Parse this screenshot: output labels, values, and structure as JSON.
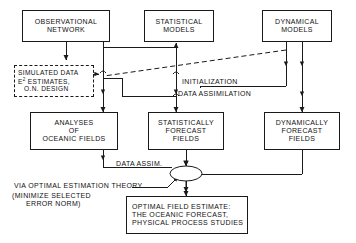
{
  "figure": {
    "type": "flowchart",
    "orientation": "top-down",
    "background_color": "#ffffff",
    "line_color": "#1a1a1a",
    "text_color": "#111111"
  },
  "nodes": {
    "observational_network": {
      "id": "observational-network",
      "shape": "rectangle",
      "border": "solid",
      "lines": [
        "OBSERVATIONAL",
        "NETWORK"
      ]
    },
    "statistical_models": {
      "id": "statistical-models",
      "shape": "rectangle",
      "border": "solid",
      "lines": [
        "STATISTICAL",
        "MODELS"
      ]
    },
    "dynamical_models": {
      "id": "dynamical-models",
      "shape": "rectangle",
      "border": "solid",
      "lines": [
        "DYNAMICAL",
        "MODELS"
      ]
    },
    "simulated_data": {
      "id": "simulated-data",
      "shape": "rectangle",
      "border": "dashed",
      "lines": [
        "SIMULATED DATA",
        "E² ESTIMATES,",
        "O.N. DESIGN"
      ],
      "line1": "SIMULATED DATA",
      "line2_prefix": "E",
      "line2_sup": "2",
      "line2_rest": " ESTIMATES,",
      "line3": "O.N. DESIGN"
    },
    "analyses_oceanic_fields": {
      "id": "analyses-of-oceanic-fields",
      "shape": "rectangle",
      "border": "solid",
      "lines": [
        "ANALYSES",
        "OF",
        "OCEANIC FIELDS"
      ]
    },
    "statistically_forecast_fields": {
      "id": "statistically-forecast-fields",
      "shape": "rectangle",
      "border": "solid",
      "lines": [
        "STATISTICALLY",
        "FORECAST",
        "FIELDS"
      ]
    },
    "dynamically_forecast_fields": {
      "id": "dynamically-forecast-fields",
      "shape": "rectangle",
      "border": "solid",
      "lines": [
        "DYNAMICALLY",
        "FORECAST",
        "FIELDS"
      ]
    },
    "optimal_field_estimate": {
      "id": "optimal-field-estimate",
      "shape": "rectangle",
      "border": "solid",
      "lines": [
        "OPTIMAL FIELD ESTIMATE:",
        "THE OCEANIC FORECAST,",
        "PHYSICAL PROCESS STUDIES"
      ]
    },
    "merge_junction": {
      "id": "merge-junction",
      "shape": "ellipse",
      "border": "solid",
      "label": ""
    }
  },
  "edge_labels": {
    "initialization": "INITIALIZATION",
    "data_assimilation": "DATA ASSIMILATION",
    "data_assim": "DATA ASSIM.",
    "via_optimal_estimation": "VIA OPTIMAL ESTIMATION THEORY",
    "minimize_line1": "(MINIMIZE SELECTED",
    "minimize_line2": "ERROR NORM)"
  },
  "edges": [
    {
      "from": "simulated_data",
      "to": "observational_network",
      "style": "solid",
      "arrow": "end"
    },
    {
      "from": "observational_network",
      "to": "analyses_oceanic_fields",
      "style": "solid",
      "arrow": "end"
    },
    {
      "from": "observational_network",
      "to": "statistical_models",
      "style": "solid",
      "arrow": "end"
    },
    {
      "from": "statistical_models",
      "to": "simulated_data",
      "style": "dashed",
      "arrow": "end"
    },
    {
      "from": "dynamical_models",
      "to": "simulated_data",
      "style": "dashed",
      "arrow": "end"
    },
    {
      "from": "statistical_models",
      "to": "statistically_forecast_fields",
      "style": "solid",
      "arrow": "end",
      "label": "initialization"
    },
    {
      "from": "dynamical_models",
      "to": "dynamically_forecast_fields",
      "style": "solid",
      "arrow": "end",
      "label": "data_assimilation"
    },
    {
      "from": "analyses_oceanic_fields",
      "to": "merge_junction",
      "style": "solid",
      "arrow": "end",
      "label": "data_assim"
    },
    {
      "from": "statistically_forecast_fields",
      "to": "merge_junction",
      "style": "solid",
      "arrow": "end"
    },
    {
      "from": "dynamically_forecast_fields",
      "to": "merge_junction",
      "style": "solid",
      "arrow": "end"
    },
    {
      "from": "merge_junction",
      "to": "optimal_field_estimate",
      "style": "solid",
      "arrow": "end",
      "label": "via_optimal_estimation"
    }
  ]
}
